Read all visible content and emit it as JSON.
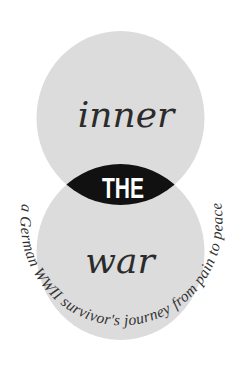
{
  "cover": {
    "title_top": "inner",
    "title_middle": "THE",
    "title_bottom": "war",
    "subtitle": "a German WWII survivor's journey from pain to peace"
  },
  "colors": {
    "background": "#ffffff",
    "circle": "#dcdcdc",
    "lens": "#111111",
    "title_text": "#2b2b2b",
    "the_text": "#ffffff",
    "subtitle_text": "#333333"
  }
}
